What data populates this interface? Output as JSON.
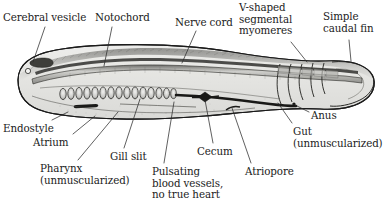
{
  "figure": {
    "background_color": "#ffffff",
    "body_fill_color": "#e2e2e0",
    "body_fill_dark": "#c9c9c6",
    "outline_color": "#1b1b1b",
    "organ_dark_color": "#1a1a1a",
    "leader_line_color": "#2b2b2b"
  },
  "labels": [
    {
      "id": "cerebral-vesicle",
      "text": "Cerebral vesicle",
      "x": 3,
      "y": 12,
      "align": "left"
    },
    {
      "id": "notochord",
      "text": "Notochord",
      "x": 95,
      "y": 12,
      "align": "left"
    },
    {
      "id": "nerve-cord",
      "text": "Nerve cord",
      "x": 175,
      "y": 17,
      "align": "left"
    },
    {
      "id": "v-shaped-segmental-myomeres",
      "text": "V-shaped\nsegmental\nmyomeres",
      "x": 239,
      "y": 2,
      "align": "left"
    },
    {
      "id": "simple-caudal-fin",
      "text": "Simple\ncaudal fin",
      "x": 323,
      "y": 11,
      "align": "left"
    },
    {
      "id": "anus",
      "text": "Anus",
      "x": 311,
      "y": 110,
      "align": "left"
    },
    {
      "id": "gut-unmuscularized",
      "text": "Gut\n(unmuscularized)",
      "x": 293,
      "y": 126,
      "align": "left"
    },
    {
      "id": "atriopore",
      "text": "Atriopore",
      "x": 245,
      "y": 166,
      "align": "left"
    },
    {
      "id": "cecum",
      "text": "Cecum",
      "x": 197,
      "y": 146,
      "align": "left"
    },
    {
      "id": "pulsating-blood-vessels",
      "text": "Pulsating\nblood vessels,\nno true heart",
      "x": 152,
      "y": 166,
      "align": "left"
    },
    {
      "id": "gill-slit",
      "text": "Gill slit",
      "x": 110,
      "y": 151,
      "align": "left"
    },
    {
      "id": "pharynx-unmuscularized",
      "text": "Pharynx\n(unmuscularized)",
      "x": 40,
      "y": 163,
      "align": "left"
    },
    {
      "id": "atrium",
      "text": "Atrium",
      "x": 33,
      "y": 137,
      "align": "left"
    },
    {
      "id": "endostyle",
      "text": "Endostyle",
      "x": 3,
      "y": 123,
      "align": "left"
    }
  ],
  "leaders": [
    {
      "id": "leader-cerebral-vesicle",
      "from": [
        45,
        27
      ],
      "to": [
        33,
        62
      ]
    },
    {
      "id": "leader-notochord",
      "from": [
        112,
        27
      ],
      "to": [
        104,
        66
      ]
    },
    {
      "id": "leader-nerve-cord",
      "from": [
        196,
        31
      ],
      "to": [
        182,
        63
      ]
    },
    {
      "id": "leader-myomeres",
      "from": [
        291,
        42
      ],
      "to": [
        307,
        62
      ]
    },
    {
      "id": "leader-caudal-fin",
      "from": [
        349,
        40
      ],
      "to": [
        351,
        61
      ]
    },
    {
      "id": "leader-anus",
      "from": [
        309,
        112
      ],
      "to": [
        293,
        104
      ]
    },
    {
      "id": "leader-gut",
      "from": [
        292,
        123
      ],
      "to": [
        278,
        103
      ]
    },
    {
      "id": "leader-atriopore",
      "from": [
        251,
        163
      ],
      "to": [
        232,
        108
      ]
    },
    {
      "id": "leader-cecum",
      "from": [
        213,
        143
      ],
      "to": [
        205,
        100
      ]
    },
    {
      "id": "leader-blood-vessels",
      "from": [
        164,
        163
      ],
      "to": [
        174,
        102
      ]
    },
    {
      "id": "leader-gill-slit",
      "from": [
        124,
        148
      ],
      "to": [
        140,
        99
      ]
    },
    {
      "id": "leader-pharynx",
      "from": [
        78,
        160
      ],
      "to": [
        118,
        112
      ]
    },
    {
      "id": "leader-atrium",
      "from": [
        73,
        134
      ],
      "to": [
        95,
        116
      ]
    },
    {
      "id": "leader-endostyle",
      "from": [
        52,
        120
      ],
      "to": [
        68,
        112
      ]
    }
  ],
  "structures": [
    {
      "id": "body-outline",
      "name": "lancelet-body-outline"
    },
    {
      "id": "cerebral-vesicle-blob",
      "name": "cerebral-vesicle-structure"
    },
    {
      "id": "eyespot",
      "name": "eyespot-structure"
    },
    {
      "id": "nerve-cord-band",
      "name": "nerve-cord-structure"
    },
    {
      "id": "notochord-band",
      "name": "notochord-structure"
    },
    {
      "id": "gill-slits",
      "name": "gill-slit-structures",
      "count": 15
    },
    {
      "id": "endostyle-bar",
      "name": "endostyle-structure"
    },
    {
      "id": "cecum-knob",
      "name": "cecum-structure"
    },
    {
      "id": "gut-tube",
      "name": "gut-structure"
    },
    {
      "id": "anus-point",
      "name": "anus-structure"
    },
    {
      "id": "atriopore-notch",
      "name": "atriopore-structure"
    },
    {
      "id": "myomere-chevrons",
      "name": "myomere-structures",
      "count": 5
    },
    {
      "id": "caudal-fin",
      "name": "caudal-fin-structure"
    }
  ]
}
